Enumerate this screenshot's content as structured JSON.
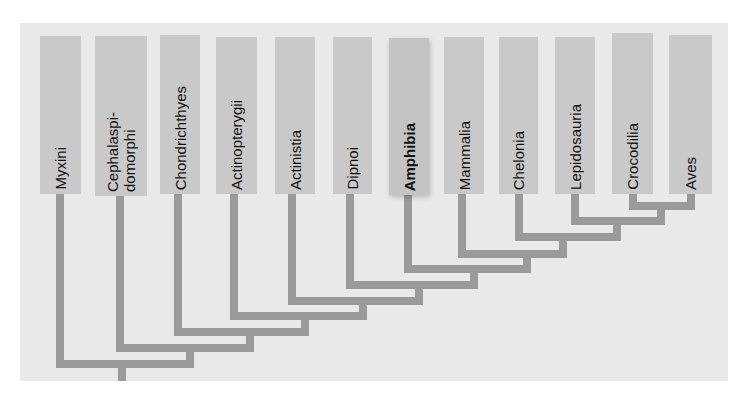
{
  "diagram": {
    "type": "cladogram",
    "colors": {
      "panel_background": "#e9e9e9",
      "label_box": "#c9c9c9",
      "branch": "#9a9a9a",
      "text": "#111111"
    },
    "highlighted_taxon": "Amphibia",
    "taxa": [
      {
        "label": "Myxini"
      },
      {
        "label": "Cephalaspi-\ndomorphi"
      },
      {
        "label": "Chondrichthyes"
      },
      {
        "label": "Actinopterygii"
      },
      {
        "label": "Actinistia"
      },
      {
        "label": "Dipnoi"
      },
      {
        "label": "Amphibia"
      },
      {
        "label": "Mammalia"
      },
      {
        "label": "Chelonia"
      },
      {
        "label": "Lepidosauria"
      },
      {
        "label": "Crocodilia"
      },
      {
        "label": "Aves"
      }
    ]
  }
}
